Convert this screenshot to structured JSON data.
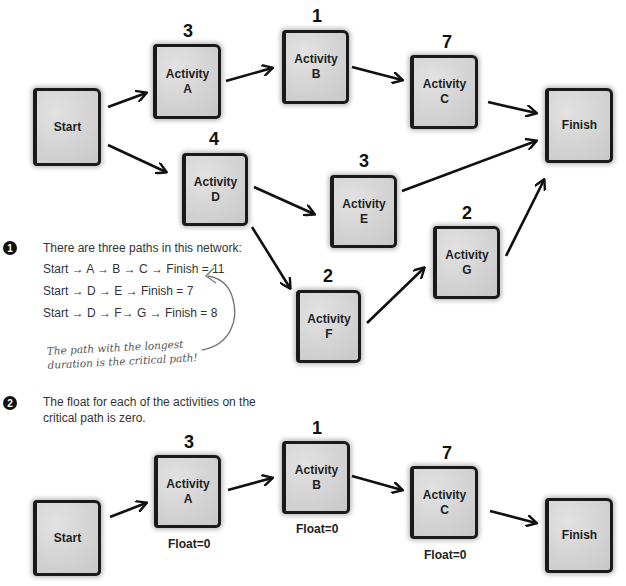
{
  "top_diagram": {
    "nodes": {
      "start": {
        "label": "Start"
      },
      "a": {
        "line1": "Activity",
        "line2": "A",
        "duration": "3"
      },
      "b": {
        "line1": "Activity",
        "line2": "B",
        "duration": "1"
      },
      "c": {
        "line1": "Activity",
        "line2": "C",
        "duration": "7"
      },
      "d": {
        "line1": "Activity",
        "line2": "D",
        "duration": "4"
      },
      "e": {
        "line1": "Activity",
        "line2": "E",
        "duration": "3"
      },
      "f": {
        "line1": "Activity",
        "line2": "F",
        "duration": "2"
      },
      "g": {
        "line1": "Activity",
        "line2": "G",
        "duration": "2"
      },
      "finish": {
        "label": "Finish"
      }
    },
    "edges": [
      [
        "Start",
        "A"
      ],
      [
        "A",
        "B"
      ],
      [
        "B",
        "C"
      ],
      [
        "C",
        "Finish"
      ],
      [
        "Start",
        "D"
      ],
      [
        "D",
        "E"
      ],
      [
        "E",
        "Finish"
      ],
      [
        "D",
        "F"
      ],
      [
        "F",
        "G"
      ],
      [
        "G",
        "Finish"
      ]
    ]
  },
  "notes": {
    "note1": {
      "bullet": "1",
      "intro": "There are three paths in this network:",
      "paths": [
        "Start → A → B → C → Finish = 11",
        "Start → D → E → Finish = 7",
        "Start → D → F→ G → Finish = 8"
      ],
      "handwritten_line1": "The path with the longest",
      "handwritten_line2": "duration is the critical path!"
    },
    "note2": {
      "bullet": "2",
      "line1": "The float for each of the activities on the",
      "line2": "critical path is zero."
    }
  },
  "bottom_diagram": {
    "nodes": {
      "start": {
        "label": "Start"
      },
      "a": {
        "line1": "Activity",
        "line2": "A",
        "duration": "3",
        "float": "Float=0"
      },
      "b": {
        "line1": "Activity",
        "line2": "B",
        "duration": "1",
        "float": "Float=0"
      },
      "c": {
        "line1": "Activity",
        "line2": "C",
        "duration": "7",
        "float": "Float=0"
      },
      "finish": {
        "label": "Finish"
      }
    },
    "edges": [
      [
        "Start",
        "A"
      ],
      [
        "A",
        "B"
      ],
      [
        "B",
        "C"
      ],
      [
        "C",
        "Finish"
      ]
    ]
  }
}
